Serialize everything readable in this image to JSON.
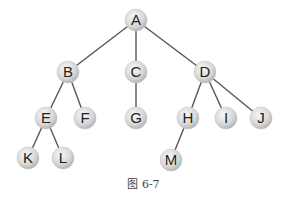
{
  "diagram": {
    "type": "tree",
    "caption": "图 6-7",
    "colors": {
      "edge": "#555555",
      "node_fill_light": "#f4f4f4",
      "node_fill_dark": "#bdbdbd",
      "label": "#222222"
    },
    "node_radius": 11,
    "nodes": [
      {
        "id": "A",
        "label": "A",
        "x": 136,
        "y": 20
      },
      {
        "id": "B",
        "label": "B",
        "x": 68,
        "y": 72
      },
      {
        "id": "C",
        "label": "C",
        "x": 136,
        "y": 72
      },
      {
        "id": "D",
        "label": "D",
        "x": 205,
        "y": 72
      },
      {
        "id": "E",
        "label": "E",
        "x": 46,
        "y": 118
      },
      {
        "id": "F",
        "label": "F",
        "x": 85,
        "y": 118
      },
      {
        "id": "G",
        "label": "G",
        "x": 136,
        "y": 118
      },
      {
        "id": "H",
        "label": "H",
        "x": 188,
        "y": 118
      },
      {
        "id": "I",
        "label": "I",
        "x": 226,
        "y": 118
      },
      {
        "id": "J",
        "label": "J",
        "x": 261,
        "y": 118
      },
      {
        "id": "K",
        "label": "K",
        "x": 28,
        "y": 158
      },
      {
        "id": "L",
        "label": "L",
        "x": 63,
        "y": 158
      },
      {
        "id": "M",
        "label": "M",
        "x": 171,
        "y": 160
      }
    ],
    "edges": [
      [
        "A",
        "B"
      ],
      [
        "A",
        "C"
      ],
      [
        "A",
        "D"
      ],
      [
        "B",
        "E"
      ],
      [
        "B",
        "F"
      ],
      [
        "C",
        "G"
      ],
      [
        "D",
        "H"
      ],
      [
        "D",
        "I"
      ],
      [
        "D",
        "J"
      ],
      [
        "E",
        "K"
      ],
      [
        "E",
        "L"
      ],
      [
        "H",
        "M"
      ]
    ]
  }
}
